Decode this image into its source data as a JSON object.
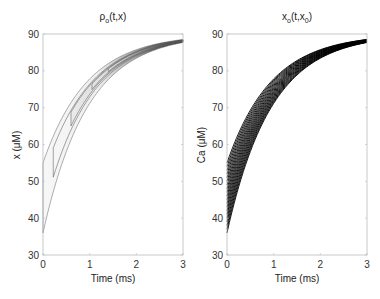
{
  "chart_data": [
    {
      "type": "heatmap",
      "title": "ρo(t,x)",
      "title_main": "ρ",
      "title_sub": "o",
      "title_rest": "(t,x)",
      "xlabel": "Time (ms)",
      "ylabel": "x (μM)",
      "xlim": [
        0,
        3
      ],
      "ylim": [
        30,
        90
      ],
      "xticks": [
        "0",
        "1",
        "2",
        "3"
      ],
      "yticks": [
        "30",
        "40",
        "50",
        "60",
        "70",
        "80",
        "90"
      ],
      "description": "Density contour band bounded by trajectories starting at x=36 and x=55, converging toward 90 μM; density increases (darker) with time",
      "band_lower_start": 36,
      "band_upper_start": 55,
      "asymptote": 90,
      "inner_contour_start_time": 0.6
    },
    {
      "type": "line",
      "title": "xo(t,x0)",
      "title_main": "x",
      "title_sub": "o",
      "title_rest2": "(t,x",
      "title_sub2": "0",
      "title_end": ")",
      "xlabel": "Time (ms)",
      "ylabel": "Ca (μM)",
      "xlim": [
        0,
        3
      ],
      "ylim": [
        30,
        90
      ],
      "xticks": [
        "0",
        "1",
        "2",
        "3"
      ],
      "yticks": [
        "30",
        "40",
        "50",
        "60",
        "70",
        "80",
        "90"
      ],
      "series_description": "Family of ~20 trajectories with initial values x0 from 36 to 55 μM, all relaxing exponentially toward ~90 μM",
      "x0_values": [
        36,
        37,
        38,
        39,
        40,
        41,
        42,
        43,
        44,
        45,
        46,
        47,
        48,
        49,
        50,
        51,
        52,
        53,
        54,
        55
      ],
      "asymptote": 90
    }
  ]
}
